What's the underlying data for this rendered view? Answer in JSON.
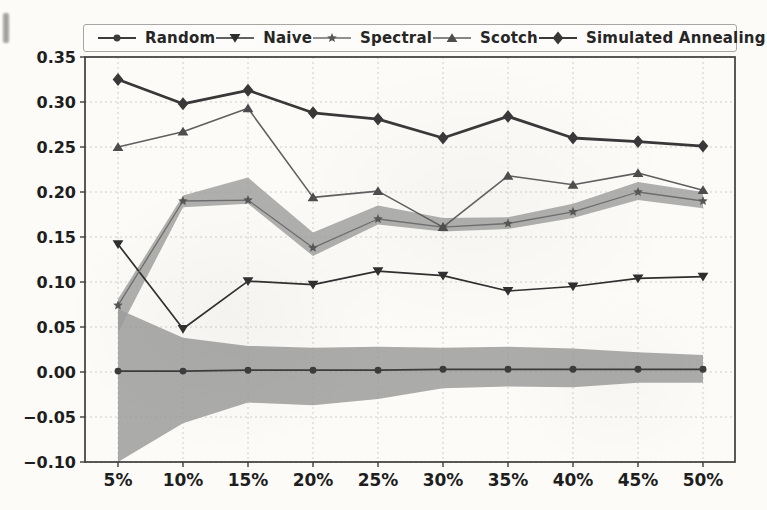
{
  "chart_data": {
    "type": "line",
    "title": "",
    "xlabel": "",
    "ylabel": "",
    "categories": [
      "5%",
      "10%",
      "15%",
      "20%",
      "25%",
      "30%",
      "35%",
      "40%",
      "45%",
      "50%"
    ],
    "ylim": [
      -0.1,
      0.35
    ],
    "yticks": [
      -0.1,
      -0.05,
      0.0,
      0.05,
      0.1,
      0.15,
      0.2,
      0.25,
      0.3,
      0.35
    ],
    "ytick_labels": [
      "−0.10",
      "−0.05",
      "0.00",
      "0.05",
      "0.10",
      "0.15",
      "0.20",
      "0.25",
      "0.30",
      "0.35"
    ],
    "grid": {
      "visible": true,
      "style": "dashed",
      "color": "#c9c8c4"
    },
    "legend": {
      "position": "top",
      "orientation": "horizontal"
    },
    "series": [
      {
        "name": "Random",
        "marker": "circle",
        "color": "#3b3b3b",
        "line_width": 1.8,
        "marker_size": 4.6,
        "values": [
          0.001,
          0.001,
          0.002,
          0.002,
          0.002,
          0.003,
          0.003,
          0.003,
          0.003,
          0.003
        ],
        "band": {
          "upper": [
            0.07,
            0.038,
            0.029,
            0.027,
            0.028,
            0.027,
            0.028,
            0.026,
            0.022,
            0.019
          ],
          "lower": [
            -0.1,
            -0.057,
            -0.034,
            -0.037,
            -0.03,
            -0.018,
            -0.016,
            -0.017,
            -0.012,
            -0.012
          ],
          "fill": "#989898",
          "opacity": 0.82
        }
      },
      {
        "name": "Naive",
        "marker": "triangle-down",
        "color": "#2e2e2e",
        "line_width": 1.7,
        "marker_size": 5.4,
        "values": [
          0.142,
          0.048,
          0.101,
          0.097,
          0.112,
          0.107,
          0.09,
          0.095,
          0.104,
          0.106
        ]
      },
      {
        "name": "Spectral",
        "marker": "star",
        "color": "#6d6d6d",
        "marker_color": "#555555",
        "line_width": 1.3,
        "marker_size": 5.0,
        "values": [
          0.074,
          0.19,
          0.191,
          0.138,
          0.17,
          0.161,
          0.165,
          0.178,
          0.2,
          0.19
        ],
        "band": {
          "upper": [
            0.081,
            0.196,
            0.216,
            0.155,
            0.185,
            0.171,
            0.172,
            0.187,
            0.211,
            0.2
          ],
          "lower": [
            0.044,
            0.183,
            0.187,
            0.129,
            0.164,
            0.156,
            0.159,
            0.171,
            0.191,
            0.182
          ],
          "fill": "#9d9d9d",
          "opacity": 0.82
        }
      },
      {
        "name": "Scotch",
        "marker": "triangle-up",
        "color": "#5f5f5f",
        "marker_color": "#4c4c4c",
        "line_width": 1.6,
        "marker_size": 5.4,
        "values": [
          0.25,
          0.267,
          0.293,
          0.194,
          0.201,
          0.161,
          0.218,
          0.208,
          0.221,
          0.202
        ]
      },
      {
        "name": "Simulated Annealing",
        "marker": "diamond",
        "color": "#383838",
        "line_width": 2.8,
        "marker_size": 5.6,
        "values": [
          0.325,
          0.298,
          0.313,
          0.288,
          0.281,
          0.26,
          0.284,
          0.26,
          0.256,
          0.251
        ]
      }
    ]
  },
  "style": {
    "axis_color": "#3c3c3c",
    "tick_label_color": "#1e1e1e",
    "background": "#fcfbf8"
  }
}
